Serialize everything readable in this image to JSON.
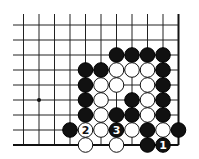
{
  "diagram": {
    "type": "go-board-fragment",
    "columns": 11,
    "rows": 9,
    "edges": [
      "right",
      "bottom"
    ],
    "star_points": [
      {
        "col": 1,
        "row": 5
      }
    ],
    "stones": [
      {
        "col": 6,
        "row": 2,
        "color": "black"
      },
      {
        "col": 7,
        "row": 2,
        "color": "black"
      },
      {
        "col": 8,
        "row": 2,
        "color": "black"
      },
      {
        "col": 9,
        "row": 2,
        "color": "black"
      },
      {
        "col": 4,
        "row": 3,
        "color": "black"
      },
      {
        "col": 5,
        "row": 3,
        "color": "black"
      },
      {
        "col": 6,
        "row": 3,
        "color": "white"
      },
      {
        "col": 7,
        "row": 3,
        "color": "white"
      },
      {
        "col": 8,
        "row": 3,
        "color": "white"
      },
      {
        "col": 9,
        "row": 3,
        "color": "black"
      },
      {
        "col": 4,
        "row": 4,
        "color": "black"
      },
      {
        "col": 5,
        "row": 4,
        "color": "white"
      },
      {
        "col": 6,
        "row": 4,
        "color": "white"
      },
      {
        "col": 8,
        "row": 4,
        "color": "white"
      },
      {
        "col": 9,
        "row": 4,
        "color": "black"
      },
      {
        "col": 4,
        "row": 5,
        "color": "black"
      },
      {
        "col": 5,
        "row": 5,
        "color": "white"
      },
      {
        "col": 7,
        "row": 5,
        "color": "black"
      },
      {
        "col": 8,
        "row": 5,
        "color": "white"
      },
      {
        "col": 9,
        "row": 5,
        "color": "black"
      },
      {
        "col": 4,
        "row": 6,
        "color": "black"
      },
      {
        "col": 5,
        "row": 6,
        "color": "white"
      },
      {
        "col": 6,
        "row": 6,
        "color": "black"
      },
      {
        "col": 7,
        "row": 6,
        "color": "black"
      },
      {
        "col": 8,
        "row": 6,
        "color": "white"
      },
      {
        "col": 9,
        "row": 6,
        "color": "black"
      },
      {
        "col": 3,
        "row": 7,
        "color": "black"
      },
      {
        "col": 4,
        "row": 7,
        "color": "white",
        "label": "2"
      },
      {
        "col": 5,
        "row": 7,
        "color": "white"
      },
      {
        "col": 6,
        "row": 7,
        "color": "black",
        "label": "3"
      },
      {
        "col": 7,
        "row": 7,
        "color": "white"
      },
      {
        "col": 8,
        "row": 7,
        "color": "black"
      },
      {
        "col": 9,
        "row": 7,
        "color": "white"
      },
      {
        "col": 10,
        "row": 7,
        "color": "black"
      },
      {
        "col": 4,
        "row": 8,
        "color": "white"
      },
      {
        "col": 6,
        "row": 8,
        "color": "white"
      },
      {
        "col": 8,
        "row": 8,
        "color": "black"
      },
      {
        "col": 9,
        "row": 8,
        "color": "black",
        "label": "1"
      }
    ],
    "move_labels": [
      "1",
      "2",
      "3"
    ]
  }
}
